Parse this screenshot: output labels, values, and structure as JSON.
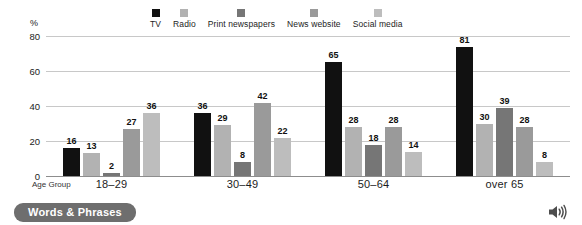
{
  "chart_data": {
    "type": "bar",
    "title": "",
    "xlabel": "Age Group",
    "ylabel": "%",
    "ylim": [
      0,
      80
    ],
    "yticks": [
      0,
      20,
      40,
      60,
      80
    ],
    "grid": true,
    "legend_position": "top",
    "categories": [
      "18–29",
      "30–49",
      "50–64",
      "over 65"
    ],
    "series": [
      {
        "name": "TV",
        "color": "#111111",
        "values": [
          16,
          36,
          65,
          81
        ]
      },
      {
        "name": "Radio",
        "color": "#b2b2b2",
        "values": [
          13,
          29,
          28,
          30
        ]
      },
      {
        "name": "Print newspapers",
        "color": "#767676",
        "values": [
          2,
          8,
          18,
          39
        ]
      },
      {
        "name": "News website",
        "color": "#9a9a9a",
        "values": [
          27,
          42,
          28,
          28
        ]
      },
      {
        "name": "Social media",
        "color": "#bdbdbd",
        "values": [
          36,
          22,
          14,
          8
        ]
      }
    ]
  },
  "footer": {
    "words_phrases_label": "Words & Phrases",
    "audio_icon": "speaker-icon"
  }
}
